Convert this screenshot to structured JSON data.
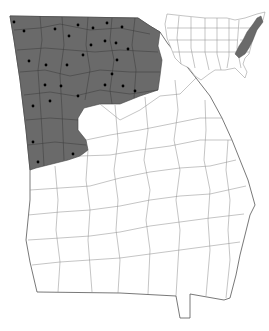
{
  "map": {
    "title": "",
    "region": "Georgia",
    "inset_region": "Contiguous United States",
    "colors": {
      "range_fill": "#6a6a6a",
      "background": "#ffffff",
      "county_border": "#8a8a8a",
      "site_marker": "#000000"
    },
    "legend": [],
    "sites": [
      [
        14,
        22
      ],
      [
        24,
        31
      ],
      [
        55,
        29
      ],
      [
        78,
        25
      ],
      [
        93,
        28
      ],
      [
        107,
        23
      ],
      [
        122,
        27
      ],
      [
        69,
        36
      ],
      [
        91,
        45
      ],
      [
        105,
        41
      ],
      [
        116,
        43
      ],
      [
        128,
        49
      ],
      [
        83,
        55
      ],
      [
        29,
        61
      ],
      [
        46,
        65
      ],
      [
        67,
        65
      ],
      [
        117,
        60
      ],
      [
        112,
        74
      ],
      [
        45,
        85
      ],
      [
        61,
        86
      ],
      [
        105,
        85
      ],
      [
        123,
        86
      ],
      [
        135,
        91
      ],
      [
        50,
        101
      ],
      [
        78,
        96
      ],
      [
        33,
        106
      ],
      [
        33,
        142
      ],
      [
        73,
        154
      ],
      [
        38,
        162
      ]
    ]
  }
}
